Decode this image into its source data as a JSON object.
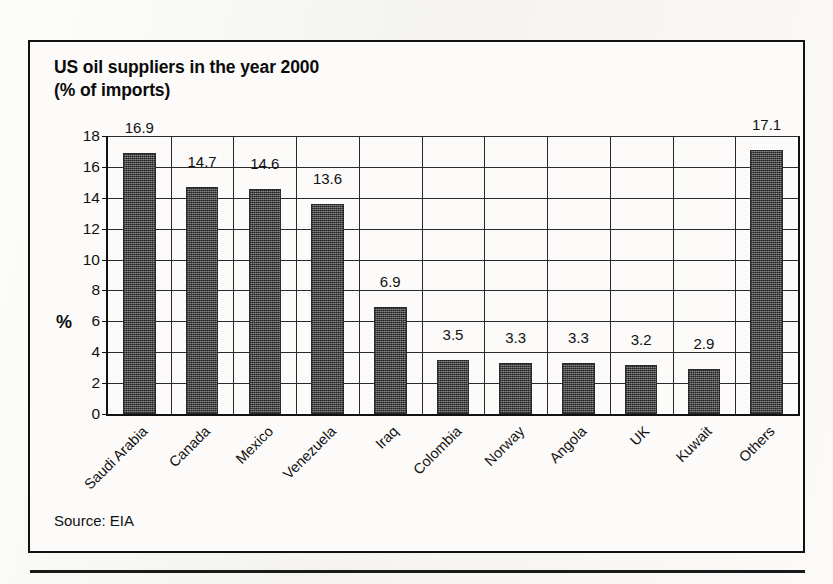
{
  "figure": {
    "title_line1": "US oil suppliers in the year 2000",
    "title_line2": "(% of imports)",
    "title": "US oil suppliers in the year 2000\n(% of imports)",
    "source_note": "Source: EIA",
    "frame_color": "#111111",
    "bar_color": "#5c5c5c",
    "paper_color": "#faf9f7"
  },
  "chart_data": {
    "type": "bar",
    "title": "US oil suppliers in the year 2000 (% of imports)",
    "xlabel": "",
    "ylabel": "%",
    "ylim": [
      0,
      18
    ],
    "ytick_step": 2,
    "yticks": [
      0,
      2,
      4,
      6,
      8,
      10,
      12,
      14,
      16,
      18
    ],
    "ytick_labels": [
      "0",
      "2",
      "4",
      "6",
      "8",
      "10",
      "12",
      "14",
      "16",
      "18"
    ],
    "grid": true,
    "grid_axis": "both",
    "legend": false,
    "value_labels": true,
    "categories": [
      "Saudi Arabia",
      "Canada",
      "Mexico",
      "Venezuela",
      "Iraq",
      "Colombia",
      "Norway",
      "Angola",
      "UK",
      "Kuwait",
      "Others"
    ],
    "values": [
      16.9,
      14.7,
      14.6,
      13.6,
      6.9,
      3.5,
      3.3,
      3.3,
      3.2,
      2.9,
      17.1
    ],
    "value_label_text": [
      "16.9",
      "14.7",
      "14.6",
      "13.6",
      "6.9",
      "3.5",
      "3.3",
      "3.3",
      "3.2",
      "2.9",
      "17.1"
    ],
    "source": "Source: EIA"
  }
}
